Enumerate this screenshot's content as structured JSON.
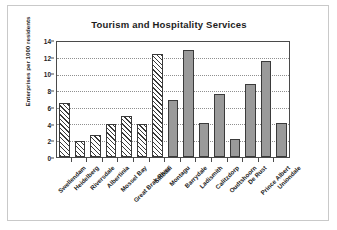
{
  "chart_data": {
    "type": "bar",
    "title": "Tourism and Hospitality Services",
    "xlabel": "",
    "ylabel": "Enterprises per 1000 residents",
    "ylim": [
      0,
      14
    ],
    "ytick_step": 2,
    "yticks": [
      "0",
      "2",
      "4",
      "6",
      "8",
      "10",
      "12",
      "14"
    ],
    "grid": true,
    "legend": "none",
    "categories": [
      "Swellendam",
      "Heidelberg",
      "Riversdale",
      "Albertinia",
      "Mossel Bay",
      "Great Brak River",
      "Stilbaai",
      "Montagu",
      "Barrydale",
      "Ladismith",
      "Calitzdorp",
      "Oudtshoorn",
      "De Rust",
      "Prince Albert",
      "Uniondale"
    ],
    "values": [
      6.6,
      2.0,
      2.7,
      4.0,
      5.0,
      4.0,
      12.5,
      6.9,
      13.0,
      4.1,
      7.7,
      2.2,
      8.9,
      11.7,
      4.2
    ],
    "bar_styles": [
      "hatched",
      "hatched",
      "hatched",
      "hatched",
      "hatched",
      "hatched",
      "hatched",
      "solid",
      "solid",
      "solid",
      "solid",
      "solid",
      "solid",
      "solid",
      "solid"
    ],
    "colors": {
      "hatched_fill": "#ffffff",
      "hatch_line": "#3a3a3a",
      "solid_fill": "#9a9a9a",
      "bar_outline": "#3a3a3a",
      "axis": "#4a4a4a",
      "gridline": "#8f8f8f",
      "text": "#1d1d1d",
      "background": "#ffffff",
      "frame_border": "#c9c9c9"
    }
  }
}
